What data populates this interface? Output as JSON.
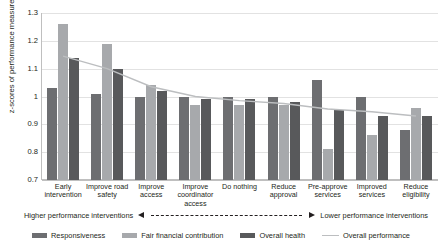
{
  "chart_data": {
    "type": "bar",
    "title": "",
    "xlabel": "",
    "ylabel": "z-scores of performance measures",
    "ylim": [
      0.7,
      1.3
    ],
    "ytick_labels": [
      "1.3",
      "1.2",
      "1.1",
      "1",
      "0.9",
      "0.8",
      "0.7"
    ],
    "yticks": [
      1.3,
      1.2,
      1.1,
      1.0,
      0.9,
      0.8,
      0.7
    ],
    "grid": true,
    "legend_position": "bottom",
    "categories": [
      "Early intervention",
      "Improve road safety",
      "Improve access",
      "Improve coordinator access",
      "Do nothing",
      "Reduce approval",
      "Pre-approve services",
      "Improved services",
      "Reduce eligibility"
    ],
    "series": [
      {
        "name": "Responsiveness",
        "type": "bar",
        "color": "#6d6e71",
        "values": [
          1.03,
          1.01,
          1.0,
          1.0,
          1.0,
          1.0,
          1.06,
          1.0,
          0.88
        ]
      },
      {
        "name": "Fair financial contribution",
        "type": "bar",
        "color": "#a7a9ac",
        "values": [
          1.26,
          1.19,
          1.04,
          0.97,
          0.97,
          0.97,
          0.81,
          0.86,
          0.96
        ]
      },
      {
        "name": "Overall health",
        "type": "bar",
        "color": "#58595b",
        "values": [
          1.14,
          1.1,
          1.02,
          0.99,
          0.99,
          0.98,
          0.95,
          0.93,
          0.93
        ]
      },
      {
        "name": "Overall performance",
        "type": "line",
        "color": "#bcbec0",
        "values": [
          1.145,
          1.1,
          1.035,
          1.0,
          0.985,
          0.975,
          0.955,
          0.945,
          0.93
        ]
      }
    ]
  },
  "annotation": {
    "left_label": "Higher performance interventions",
    "right_label": "Lower performance interventions"
  }
}
